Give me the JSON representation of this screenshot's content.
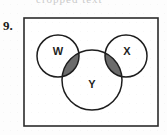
{
  "figure": {
    "problem_number": "9.",
    "header_fragment": "cropped text",
    "canvas": {
      "width": 167,
      "height": 135
    },
    "background_color": "#fdfdfd"
  },
  "frame": {
    "x": 24,
    "y": 18,
    "width": 134,
    "height": 108,
    "stroke_color": "#2b2b2b",
    "stroke_width": 1.6,
    "fill_color": "#ffffff"
  },
  "diagram": {
    "type": "venn",
    "set_count": 3,
    "shaded_description": "W intersect Y and X intersect Y",
    "shade_color": "#6b6b6b",
    "outline_color": "#1e1e1e",
    "circle_fill": "#ffffff",
    "circles": [
      {
        "label": "W",
        "cx": 58,
        "cy": 56,
        "r": 21,
        "label_x": 58,
        "label_y": 52
      },
      {
        "label": "X",
        "cx": 126,
        "cy": 56,
        "r": 21,
        "label_x": 127,
        "label_y": 52
      },
      {
        "label": "Y",
        "cx": 92,
        "cy": 80,
        "r": 30,
        "label_x": 92,
        "label_y": 85
      }
    ],
    "labels": {
      "w": "W",
      "x": "X",
      "y": "Y"
    }
  }
}
